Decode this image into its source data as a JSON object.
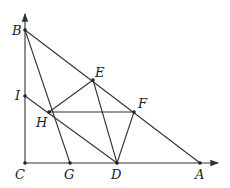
{
  "diagram": {
    "type": "geometry",
    "points": {
      "C": {
        "x": 25,
        "y": 163,
        "label": "C"
      },
      "B": {
        "x": 25,
        "y": 30,
        "label": "B"
      },
      "I": {
        "x": 25,
        "y": 96,
        "label": "I"
      },
      "H": {
        "x": 49,
        "y": 112,
        "label": "H"
      },
      "G": {
        "x": 70,
        "y": 163,
        "label": "G"
      },
      "D": {
        "x": 117,
        "y": 163,
        "label": "D"
      },
      "A": {
        "x": 200,
        "y": 163,
        "label": "A"
      },
      "E": {
        "x": 93,
        "y": 80,
        "label": "E"
      },
      "F": {
        "x": 134,
        "y": 112,
        "label": "F"
      }
    },
    "segments": [
      [
        "B",
        "A"
      ],
      [
        "B",
        "D"
      ],
      [
        "B",
        "G"
      ],
      [
        "I",
        "D"
      ],
      [
        "H",
        "E"
      ],
      [
        "H",
        "F"
      ],
      [
        "E",
        "D"
      ],
      [
        "F",
        "D"
      ]
    ],
    "axes": {
      "vertical": "C-up",
      "horizontal": "C-right"
    }
  }
}
